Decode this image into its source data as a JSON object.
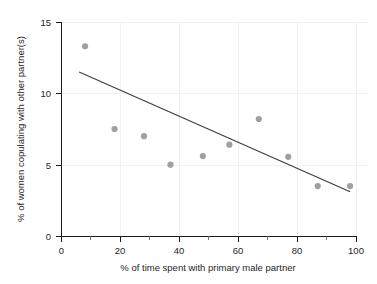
{
  "chart_data": {
    "type": "scatter",
    "title": "",
    "xlabel": "% of time spent with primary male partner",
    "ylabel": "% of women copulating with other partner(s)",
    "xlim": [
      0,
      100
    ],
    "ylim": [
      0,
      15
    ],
    "xticks": [
      0,
      20,
      40,
      60,
      80,
      100
    ],
    "xticklabels": [
      "0",
      "20",
      "40",
      "60",
      "80",
      "100"
    ],
    "xminorticks": [
      10,
      30,
      50,
      70,
      90
    ],
    "yticks": [
      0,
      5,
      10,
      15
    ],
    "yticklabels": [
      "0",
      "5",
      "10",
      "15"
    ],
    "grid": "light vertical gridlines at x=20,40,60,80 and faint horizontal gridlines at y=5,10,15",
    "legend": "none",
    "points": [
      {
        "x": 8,
        "y": 13.3
      },
      {
        "x": 18,
        "y": 7.5
      },
      {
        "x": 28,
        "y": 7.0
      },
      {
        "x": 37,
        "y": 5.0
      },
      {
        "x": 48,
        "y": 5.6
      },
      {
        "x": 57,
        "y": 6.4
      },
      {
        "x": 67,
        "y": 8.2
      },
      {
        "x": 77,
        "y": 5.55
      },
      {
        "x": 87,
        "y": 3.5
      },
      {
        "x": 98,
        "y": 3.5
      }
    ],
    "trendline": {
      "type": "linear-fit",
      "x_start": 6,
      "y_start": 11.5,
      "x_end": 98,
      "y_end": 3.1
    }
  }
}
